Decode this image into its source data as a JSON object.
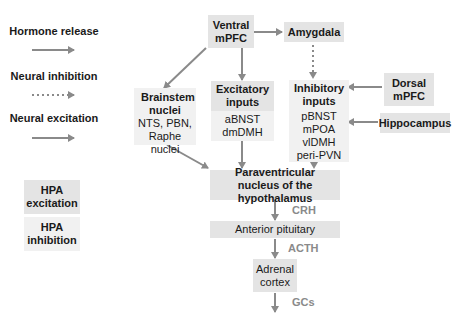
{
  "legend": {
    "hormone_release": "Hormone release",
    "neural_inhibition": "Neural inhibition",
    "neural_excitation": "Neural excitation",
    "hpa_excitation": "HPA excitation",
    "hpa_inhibition": "HPA inhibition"
  },
  "nodes": {
    "ventral_mpfc": "Ventral mPFC",
    "amygdala": "Amygdala",
    "brainstem": {
      "title": "Brainstem nuclei",
      "items": "NTS, PBN, Raphe nuclei"
    },
    "excitatory": {
      "title": "Excitatory inputs",
      "items": [
        "aBNST",
        "dmDMH"
      ]
    },
    "inhibitory": {
      "title": "Inhibitory inputs",
      "items": [
        "pBNST",
        "mPOA",
        "vlDMH",
        "peri-PVN"
      ]
    },
    "dorsal_mpfc": "Dorsal mPFC",
    "hippocampus": "Hippocampus",
    "pvn": "Paraventricular nucleus of the hypothalamus",
    "anterior_pituitary": "Anterior pituitary",
    "adrenal_cortex": "Adrenal cortex"
  },
  "hormones": {
    "crh": "CRH",
    "acth": "ACTH",
    "gcs": "GCs"
  },
  "colors": {
    "arrow": "#8a8a8a",
    "box_dark": "#e4e4e4",
    "box_light": "#f1f1f1"
  }
}
